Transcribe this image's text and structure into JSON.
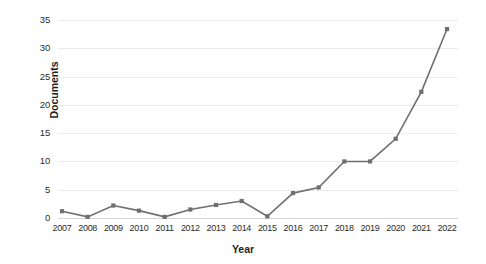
{
  "chart_data": {
    "type": "line",
    "title": "",
    "xlabel": "Year",
    "ylabel": "Documents",
    "categories": [
      "2007",
      "2008",
      "2009",
      "2010",
      "2011",
      "2012",
      "2013",
      "2014",
      "2015",
      "2016",
      "2017",
      "2018",
      "2019",
      "2020",
      "2021",
      "2022"
    ],
    "values": [
      1.2,
      0.2,
      2.2,
      1.3,
      0.2,
      1.5,
      2.3,
      3.0,
      0.3,
      4.4,
      5.4,
      10.0,
      10.0,
      14.0,
      22.3,
      33.4
    ],
    "ylim": [
      0,
      35
    ],
    "xlim": [
      "2007",
      "2022"
    ],
    "ytick_labels": [
      "0",
      "5",
      "10",
      "15",
      "20",
      "25",
      "30",
      "35"
    ],
    "ytick_values": [
      0,
      5,
      10,
      15,
      20,
      25,
      30,
      35
    ],
    "grid": true,
    "legend": "none",
    "marker": "square",
    "series_color": "#6f6f6f",
    "grid_color": "#eceaea",
    "text_color": "#2b2b2b"
  }
}
